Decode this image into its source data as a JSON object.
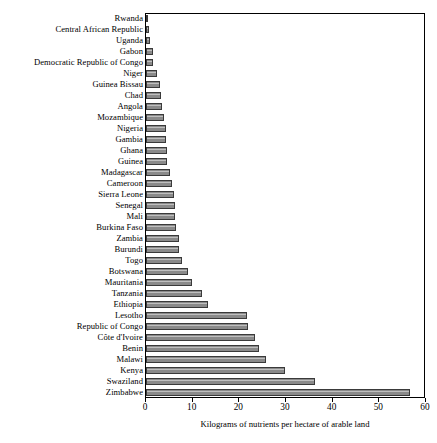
{
  "chart_data": {
    "type": "bar",
    "orientation": "horizontal",
    "title": "",
    "xlabel": "Kilograms of nutrients per hectare of arable land",
    "ylabel": "",
    "xlim": [
      0,
      60
    ],
    "xticks": [
      0,
      10,
      20,
      30,
      40,
      50,
      60
    ],
    "xticklabels": [
      "0",
      "10",
      "20",
      "30",
      "40",
      "50",
      "60"
    ],
    "grid": false,
    "legend": null,
    "bar_color": "#8a8a8a",
    "bar_edge_color": "#3a3a3a",
    "categories": [
      "Rwanda",
      "Central African Republic",
      "Uganda",
      "Gabon",
      "Democratic Republic of Congo",
      "Niger",
      "Guinea Bissau",
      "Chad",
      "Angola",
      "Mozambique",
      "Nigeria",
      "Gambia",
      "Ghana",
      "Guinea",
      "Madagascar",
      "Cameroon",
      "Sierra Leone",
      "Senegal",
      "Mali",
      "Burkina Faso",
      "Zambia",
      "Burundi",
      "Togo",
      "Botswana",
      "Mauritania",
      "Tanzania",
      "Ethiopia",
      "Lesotho",
      "Republic of Congo",
      "Côte d'Ivoire",
      "Benin",
      "Malawi",
      "Kenya",
      "Swaziland",
      "Zimbabwe"
    ],
    "values": [
      0.2,
      0.7,
      0.8,
      1.4,
      1.5,
      2.3,
      3.0,
      3.3,
      3.4,
      3.8,
      4.2,
      4.4,
      4.5,
      4.6,
      5.2,
      5.6,
      6.1,
      6.2,
      6.3,
      6.4,
      7.0,
      7.1,
      7.8,
      9.0,
      9.8,
      12.0,
      13.3,
      21.7,
      21.9,
      23.5,
      24.3,
      25.8,
      29.9,
      36.4,
      56.8
    ]
  }
}
